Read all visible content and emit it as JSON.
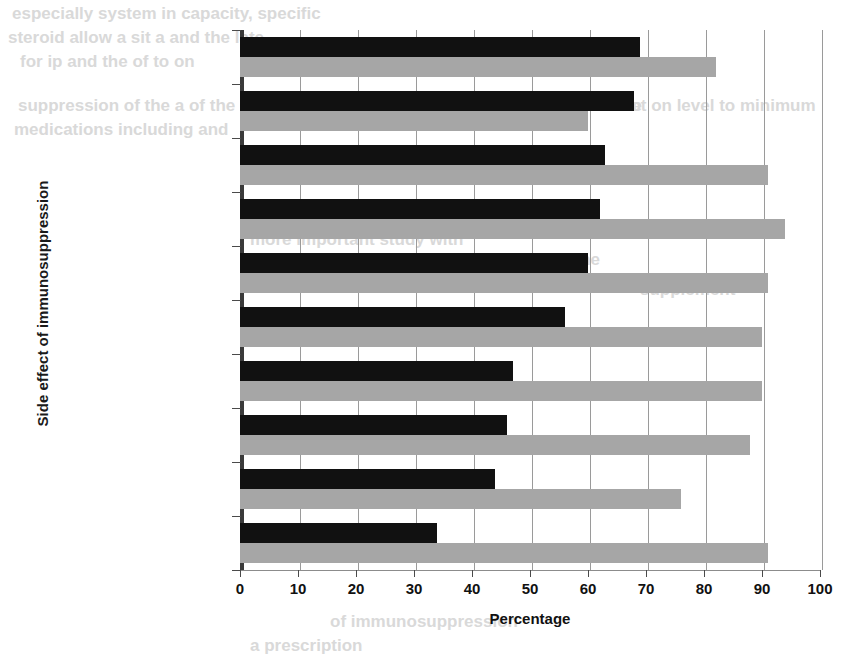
{
  "chart_data": {
    "type": "bar",
    "orientation": "horizontal",
    "title": "",
    "xlabel": "Percentage",
    "ylabel": "Side effect of immunosuppression",
    "xlim": [
      0,
      100
    ],
    "xticks": [
      0,
      10,
      20,
      30,
      40,
      50,
      60,
      70,
      80,
      90,
      100
    ],
    "grid": true,
    "legend": "none",
    "categories": [
      "Tremor",
      "Hirsutism",
      "Changed appearance",
      "GI complaints",
      "Fragile skin",
      "Muscle weakness",
      "Adiposity",
      "Poor concentration",
      "Edema",
      "Moon face"
    ],
    "series": [
      {
        "name": "dark",
        "color": "#111111",
        "values": [
          69,
          68,
          63,
          62,
          60,
          56,
          47,
          46,
          44,
          34
        ]
      },
      {
        "name": "light",
        "color": "#a6a6a6",
        "values": [
          82,
          60,
          91,
          94,
          91,
          90,
          90,
          88,
          76,
          91
        ]
      }
    ]
  },
  "background_bleed": [
    {
      "text": "especially system in capacity, specific",
      "x": 12,
      "y": 4
    },
    {
      "text": "steroid allow a sit a and the late",
      "x": 8,
      "y": 28
    },
    {
      "text": "for ip and the of to on",
      "x": 20,
      "y": 52
    },
    {
      "text": "suppression of the a of the",
      "x": 18,
      "y": 96
    },
    {
      "text": "medications including and",
      "x": 14,
      "y": 120
    },
    {
      "text": "with that to of the the",
      "x": 470,
      "y": 96
    },
    {
      "text": "not on level to minimum",
      "x": 620,
      "y": 96
    },
    {
      "text": "more important study with",
      "x": 250,
      "y": 230
    },
    {
      "text": "shown in prednisone",
      "x": 430,
      "y": 250
    },
    {
      "text": "supplement",
      "x": 640,
      "y": 280
    },
    {
      "text": "of immunosuppression",
      "x": 330,
      "y": 612
    },
    {
      "text": "a prescription",
      "x": 250,
      "y": 636
    }
  ]
}
